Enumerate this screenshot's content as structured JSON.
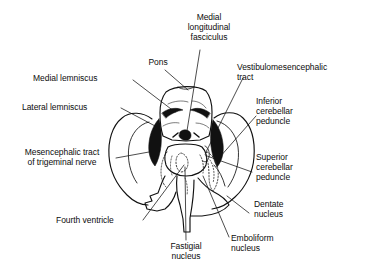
{
  "figure": {
    "background_color": "#ffffff",
    "ink_color": "#0d0d0d",
    "width": 365,
    "height": 277
  },
  "labels": {
    "medial_longitudinal_fasciculus": "Medial\nlongitudinal\nfasciculus",
    "pons": "Pons",
    "vestibulomesencephalic_tract": "Vestibulomesencephalic\ntract",
    "medial_lemniscus": "Medial lemniscus",
    "inferior_cerebellar_peduncle": "Inferior\ncerebellar\npeduncle",
    "lateral_lemniscus": "Lateral lemniscus",
    "mesencephalic_tract_of_trigeminal_nerve": "Mesencephalic tract\nof trigeminal nerve",
    "superior_cerebellar_peduncle": "Superior\ncerebellar\npeduncle",
    "fourth_ventricle": "Fourth ventricle",
    "dentate_nucleus": "Dentate\nnucleus",
    "fastigial_nucleus": "Fastigial\nnucleus",
    "emboliform_nucleus": "Emboliform\nnucleus"
  }
}
